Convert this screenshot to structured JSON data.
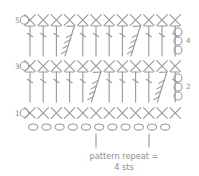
{
  "figure": {
    "type": "crochet-stitch-chart",
    "width": 199,
    "height": 176,
    "background": "#ffffff",
    "ink_color": "#9a9a9a",
    "label_color": "#8d8d8d"
  },
  "caption": {
    "line1": "pattern repeat =",
    "line2": "4 sts",
    "repeat_stitches": 4
  },
  "row_labels_left": [
    {
      "row": "5",
      "turning_chain_symbol": "0"
    },
    {
      "row": "3",
      "turning_chain_symbol": "0"
    },
    {
      "row": "1",
      "turning_chain_symbol": "0"
    }
  ],
  "row_labels_right": [
    {
      "row": "4",
      "turning_chain_symbol": "0",
      "chain_count": 3
    },
    {
      "row": "2",
      "turning_chain_symbol": "0",
      "chain_count": 3
    }
  ],
  "legend_symbols": [
    {
      "name": "chain",
      "glyph": "0"
    },
    {
      "name": "single-crochet",
      "glyph": "X"
    },
    {
      "name": "double-crochet",
      "glyph": "T"
    },
    {
      "name": "cluster",
      "glyph": "fan"
    }
  ],
  "chart_data": {
    "type": "table",
    "rows": [
      {
        "id": "row5-sc",
        "label": "5",
        "stitch": "single-crochet",
        "count": 12,
        "y": 20
      },
      {
        "id": "row4-dc",
        "label": "4",
        "stitch": "double-crochet",
        "count": 12,
        "clusters_at": [
          3,
          8
        ],
        "y": 42
      },
      {
        "id": "row3-sc",
        "label": "3",
        "stitch": "single-crochet",
        "count": 12,
        "y": 66
      },
      {
        "id": "row2-dc",
        "label": "2",
        "stitch": "double-crochet",
        "count": 12,
        "clusters_at": [
          5,
          10
        ],
        "y": 88
      },
      {
        "id": "row1-sc",
        "label": "1",
        "stitch": "single-crochet",
        "count": 12,
        "y": 113
      },
      {
        "id": "foundation-chain",
        "label": "",
        "stitch": "chain",
        "count": 11,
        "y": 127
      }
    ],
    "repeat_markers_x": [
      96,
      149
    ],
    "xlabel": "",
    "ylabel": ""
  }
}
